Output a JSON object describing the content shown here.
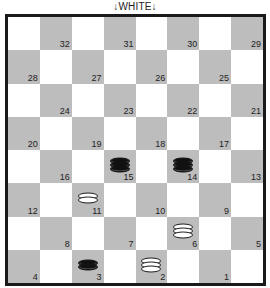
{
  "header": {
    "label": "↓WHITE↓"
  },
  "colors": {
    "light": "#ffffff",
    "dark": "#bdbdbd",
    "border": "#1a1a1a"
  },
  "board": {
    "rows": [
      [
        {
          "n": null
        },
        {
          "n": "32"
        },
        {
          "n": null
        },
        {
          "n": "31"
        },
        {
          "n": null
        },
        {
          "n": "30"
        },
        {
          "n": null
        },
        {
          "n": "29"
        }
      ],
      [
        {
          "n": "28"
        },
        {
          "n": null
        },
        {
          "n": "27"
        },
        {
          "n": null
        },
        {
          "n": "26"
        },
        {
          "n": null
        },
        {
          "n": "25"
        },
        {
          "n": null
        }
      ],
      [
        {
          "n": null
        },
        {
          "n": "24"
        },
        {
          "n": null
        },
        {
          "n": "23"
        },
        {
          "n": null
        },
        {
          "n": "22"
        },
        {
          "n": null
        },
        {
          "n": "21"
        }
      ],
      [
        {
          "n": "20"
        },
        {
          "n": null
        },
        {
          "n": "19"
        },
        {
          "n": null
        },
        {
          "n": "18"
        },
        {
          "n": null
        },
        {
          "n": "17"
        },
        {
          "n": null
        }
      ],
      [
        {
          "n": null
        },
        {
          "n": "16"
        },
        {
          "n": null
        },
        {
          "n": "15",
          "piece": "black",
          "king": true
        },
        {
          "n": null
        },
        {
          "n": "14",
          "piece": "black",
          "king": true
        },
        {
          "n": null
        },
        {
          "n": "13"
        }
      ],
      [
        {
          "n": "12"
        },
        {
          "n": null
        },
        {
          "n": "11",
          "piece": "white",
          "king": false
        },
        {
          "n": null
        },
        {
          "n": "10"
        },
        {
          "n": null
        },
        {
          "n": "9"
        },
        {
          "n": null
        }
      ],
      [
        {
          "n": null
        },
        {
          "n": "8"
        },
        {
          "n": null
        },
        {
          "n": "7"
        },
        {
          "n": null
        },
        {
          "n": "6",
          "piece": "white",
          "king": true
        },
        {
          "n": null
        },
        {
          "n": "5"
        }
      ],
      [
        {
          "n": "4"
        },
        {
          "n": null
        },
        {
          "n": "3",
          "piece": "black",
          "king": false
        },
        {
          "n": null
        },
        {
          "n": "2",
          "piece": "white",
          "king": true
        },
        {
          "n": null
        },
        {
          "n": "1"
        },
        {
          "n": null
        }
      ]
    ]
  },
  "pieces": [
    {
      "square": "15",
      "color": "black",
      "type": "king"
    },
    {
      "square": "14",
      "color": "black",
      "type": "king"
    },
    {
      "square": "3",
      "color": "black",
      "type": "man"
    },
    {
      "square": "11",
      "color": "white",
      "type": "man"
    },
    {
      "square": "6",
      "color": "white",
      "type": "king"
    },
    {
      "square": "2",
      "color": "white",
      "type": "king"
    }
  ]
}
